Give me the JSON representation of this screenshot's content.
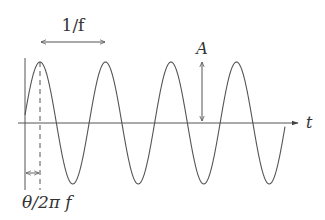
{
  "labels": {
    "period": "1/f",
    "amplitude": "A",
    "time_axis": "t",
    "phase": "θ/2π f"
  },
  "colors": {
    "line": "#555555",
    "text": "#333333",
    "background": "#ffffff"
  },
  "chart_data": {
    "type": "line",
    "title": "",
    "xlabel": "t",
    "ylabel": "",
    "cycles_shown": 4,
    "annotations": [
      {
        "label": "1/f",
        "meaning": "period, peak-to-peak horizontal arrow"
      },
      {
        "label": "A",
        "meaning": "amplitude, vertical arrow from axis to peak"
      },
      {
        "label": "θ/2π f",
        "meaning": "phase offset, arrow from origin to first peak"
      }
    ],
    "geometry_px": {
      "origin_x": 25,
      "axis_y": 123,
      "period_px": 65.5,
      "amplitude_px": 61,
      "first_peak_x": 40,
      "wave_end_x": 285,
      "axis_end_x": 298
    },
    "grid": false,
    "legend": "none"
  }
}
